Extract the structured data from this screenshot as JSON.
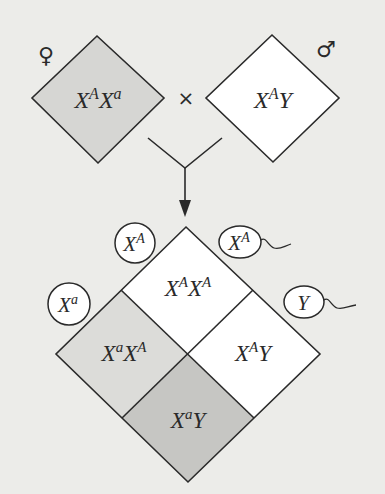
{
  "diagram": {
    "type": "punnett-square-x-linked-cross",
    "parents": {
      "female": {
        "symbol": "♀",
        "genotype": {
          "base1": "X",
          "sup1": "A",
          "base2": "X",
          "sup2": "a"
        },
        "fill": "#d6d6d3"
      },
      "cross_symbol": "×",
      "male": {
        "symbol": "♂",
        "genotype": {
          "base1": "X",
          "sup1": "A",
          "base2": "Y",
          "sup2": ""
        },
        "fill": "#ffffff"
      }
    },
    "gametes": {
      "eggs": [
        {
          "base": "X",
          "sup": "A"
        },
        {
          "base": "X",
          "sup": "a"
        }
      ],
      "sperm": [
        {
          "base": "X",
          "sup": "A"
        },
        {
          "base": "Y",
          "sup": ""
        }
      ]
    },
    "offspring": [
      {
        "position": "top",
        "base1": "X",
        "sup1": "A",
        "base2": "X",
        "sup2": "A",
        "fill": "#ffffff"
      },
      {
        "position": "left",
        "base1": "X",
        "sup1": "a",
        "base2": "X",
        "sup2": "A",
        "fill": "#dcdcd9"
      },
      {
        "position": "right",
        "base1": "X",
        "sup1": "A",
        "base2": "Y",
        "sup2": "",
        "fill": "#ffffff"
      },
      {
        "position": "bottom",
        "base1": "X",
        "sup1": "a",
        "base2": "Y",
        "sup2": "",
        "fill": "#c6c6c3"
      }
    ],
    "colors": {
      "background": "#ecece9",
      "stroke": "#2a2a2a"
    }
  }
}
